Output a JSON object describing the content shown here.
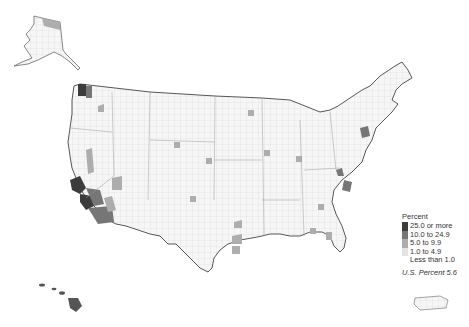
{
  "map": {
    "type": "choropleth",
    "region": "United States by county",
    "insets": [
      "Alaska",
      "Hawaii",
      "Puerto Rico"
    ]
  },
  "legend": {
    "title": "Percent",
    "classes": [
      {
        "label": "25.0 or more",
        "color": "#3c3c3c"
      },
      {
        "label": "10.0 to 24.9",
        "color": "#767676"
      },
      {
        "label": "5.0 to 9.9",
        "color": "#adadad"
      },
      {
        "label": "1.0 to 4.9",
        "color": "#e3e3e3"
      },
      {
        "label": "Less than 1.0",
        "color": "#ffffff"
      }
    ],
    "footnote": "U.S. Percent 5.6"
  },
  "colors": {
    "border": "#444444",
    "county_line": "#c8c8c8"
  }
}
